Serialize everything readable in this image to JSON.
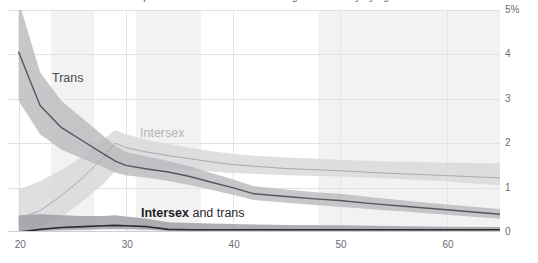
{
  "title_sliver": "prevalence of intersex and transgender identity by age",
  "axes": {
    "y_ticks": [
      "5%",
      "4",
      "3",
      "2",
      "1",
      "0"
    ],
    "y_values": [
      5,
      4,
      3,
      2,
      1,
      0
    ],
    "x_ticks": [
      "20",
      "30",
      "40",
      "50",
      "60"
    ],
    "x_values": [
      20,
      30,
      40,
      50,
      60
    ]
  },
  "annotations": {
    "trans": "Trans",
    "intersex": "Intersex",
    "both_bold": "Intersex",
    "both_rest": " and trans"
  },
  "colors": {
    "trans_line": "#55555d",
    "trans_band": "#b9b9bd",
    "intersex_line": "#a9a9ae",
    "intersex_band": "#d9d9dc",
    "both_line": "#2b2b31",
    "both_band": "#9a9aa0",
    "grid": "#e2e2e4",
    "vband": "#f2f2f2",
    "tick_text": "#6b6b72"
  },
  "chart_data": {
    "type": "line",
    "title": "Prevalence of intersex and transgender identity by age",
    "xlabel": "",
    "ylabel": "",
    "xlim": [
      19,
      65
    ],
    "ylim": [
      0,
      5
    ],
    "grid": true,
    "legend": "inline-annotations",
    "y_unit": "%",
    "x": [
      20,
      22,
      24,
      26,
      28,
      29,
      30,
      32,
      34,
      36,
      38,
      40,
      42,
      45,
      48,
      50,
      53,
      56,
      60,
      65
    ],
    "series": [
      {
        "name": "Trans",
        "color": "#55555d",
        "values": [
          4.05,
          2.85,
          2.35,
          2.05,
          1.75,
          1.6,
          1.5,
          1.42,
          1.35,
          1.25,
          1.12,
          1.0,
          0.86,
          0.8,
          0.74,
          0.71,
          0.64,
          0.58,
          0.5,
          0.4
        ],
        "band_low": [
          2.95,
          2.2,
          1.85,
          1.65,
          1.45,
          1.34,
          1.28,
          1.22,
          1.15,
          1.06,
          0.95,
          0.84,
          0.72,
          0.66,
          0.6,
          0.57,
          0.51,
          0.46,
          0.39,
          0.3
        ],
        "band_high": [
          5.2,
          3.6,
          2.95,
          2.55,
          2.15,
          1.95,
          1.8,
          1.7,
          1.6,
          1.48,
          1.33,
          1.19,
          1.03,
          0.96,
          0.89,
          0.86,
          0.78,
          0.71,
          0.62,
          0.52
        ]
      },
      {
        "name": "Intersex",
        "color": "#a9a9ae",
        "values": [
          0.3,
          0.48,
          0.82,
          1.22,
          1.7,
          2.0,
          1.9,
          1.8,
          1.72,
          1.65,
          1.58,
          1.52,
          1.48,
          1.43,
          1.4,
          1.38,
          1.34,
          1.31,
          1.27,
          1.22
        ],
        "band_low": [
          0.05,
          0.12,
          0.34,
          0.7,
          1.1,
          1.38,
          1.48,
          1.45,
          1.42,
          1.39,
          1.36,
          1.33,
          1.31,
          1.28,
          1.26,
          1.25,
          1.22,
          1.19,
          1.14,
          1.05
        ],
        "band_high": [
          0.95,
          1.15,
          1.4,
          1.7,
          2.1,
          2.3,
          2.2,
          2.08,
          1.98,
          1.9,
          1.82,
          1.76,
          1.72,
          1.68,
          1.65,
          1.63,
          1.6,
          1.58,
          1.56,
          1.55
        ]
      },
      {
        "name": "Intersex and trans",
        "color": "#2b2b31",
        "values": [
          0.0,
          0.06,
          0.1,
          0.12,
          0.14,
          0.15,
          0.14,
          0.12,
          0.06,
          0.05,
          0.05,
          0.05,
          0.05,
          0.05,
          0.05,
          0.05,
          0.05,
          0.05,
          0.05,
          0.05
        ],
        "band_low": [
          0.0,
          0.02,
          0.04,
          0.05,
          0.06,
          0.06,
          0.06,
          0.05,
          0.02,
          0.02,
          0.02,
          0.02,
          0.02,
          0.02,
          0.02,
          0.02,
          0.02,
          0.02,
          0.02,
          0.02
        ],
        "band_high": [
          0.38,
          0.4,
          0.38,
          0.36,
          0.36,
          0.38,
          0.35,
          0.3,
          0.22,
          0.2,
          0.19,
          0.18,
          0.17,
          0.16,
          0.15,
          0.15,
          0.14,
          0.13,
          0.12,
          0.11
        ]
      }
    ],
    "background_bands_x": [
      [
        23,
        27
      ],
      [
        31,
        37
      ],
      [
        48,
        65
      ]
    ]
  }
}
